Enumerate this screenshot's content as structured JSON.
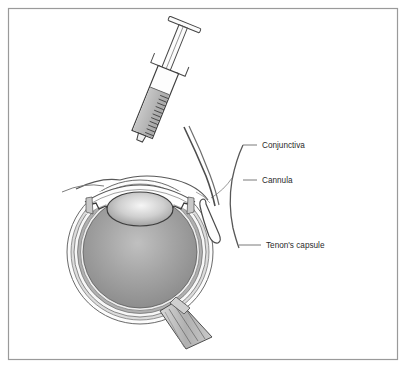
{
  "figure": {
    "border_color": "#9a9a9a",
    "background": "#ffffff"
  },
  "labels": [
    {
      "id": "conjunctiva",
      "text": "Conjunctiva",
      "x": 262,
      "y": 148,
      "leader_x1": 243,
      "leader_x2": 257,
      "leader_y": 145
    },
    {
      "id": "cannula",
      "text": "Cannula",
      "x": 262,
      "y": 183,
      "leader_x1": 243,
      "leader_x2": 257,
      "leader_y": 180
    },
    {
      "id": "tenons_capsule",
      "text": "Tenon's capsule",
      "x": 266,
      "y": 248,
      "leader_x1": 239,
      "leader_x2": 261,
      "leader_y": 245
    }
  ],
  "colors": {
    "outline": "#3a3a3a",
    "leader": "#6f6f6f",
    "label_text": "#2a2a2a",
    "syringe_fluid": "#b9b9b9",
    "syringe_barrel": "#fdfdfd",
    "vitreous_center": "#b6b6b6",
    "vitreous_edge": "#8d8d8d",
    "lens_center": "#f3f3f3",
    "lens_edge": "#9d9d9d",
    "sclera": "#fbfbfb",
    "choroid": "#a8a8a8",
    "tenons_layer": "#d8d8d8",
    "optic_nerve": "#bdbdbd",
    "cannula_tube": "#5a5a5a"
  },
  "parts": {
    "syringe": {
      "name": "syringe",
      "plunger_rest": "T-shaped thumb rest",
      "barrel": "graduated barrel",
      "graduation_marks": 11,
      "fluid_label": "anaesthetic fluid",
      "angle_deg": 22
    },
    "eye": {
      "name": "eye-cross-section",
      "structures": [
        "cornea",
        "lens",
        "iris",
        "ciliary-body",
        "sclera",
        "choroid",
        "retina",
        "vitreous",
        "optic-nerve"
      ],
      "center_x": 140,
      "center_y": 252,
      "radius_x": 72,
      "radius_y": 72
    },
    "cannula": {
      "name": "cannula",
      "description": "curved blunt cannula inserted into sub-Tenon's space"
    },
    "conjunctiva": {
      "name": "conjunctiva",
      "description": "thin membrane lifted over the cannula"
    },
    "tenons_capsule": {
      "name": "tenons-capsule",
      "description": "fibrous layer around the globe"
    }
  }
}
